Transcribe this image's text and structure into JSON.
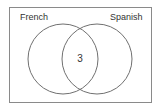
{
  "diagram": {
    "type": "venn",
    "sets": [
      {
        "label": "French"
      },
      {
        "label": "Spanish"
      }
    ],
    "regions": {
      "french_only": "",
      "spanish_only": "",
      "intersection": "3",
      "outside": ""
    },
    "colors": {
      "stroke": "#707070",
      "frame": "#8a8a8a",
      "text": "#333333",
      "background": "#ffffff"
    }
  }
}
